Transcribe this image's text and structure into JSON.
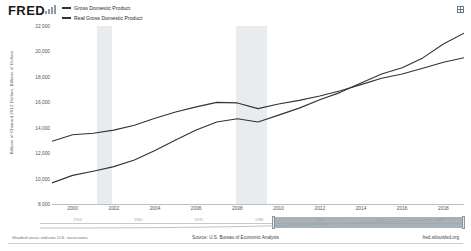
{
  "brand": {
    "name": "FRED",
    "logo_icon": "fred-bars-icon"
  },
  "header": {
    "expand_icon": "expand-icon"
  },
  "legend": {
    "position": "top-left",
    "items": [
      {
        "label": "Gross Domestic Product",
        "color": "#2f3437"
      },
      {
        "label": "Real Gross Domestic Product",
        "color": "#2f3437"
      }
    ]
  },
  "footer": {
    "note": "Shaded areas indicate U.S. recessions",
    "source": "Source: U.S. Bureau of Economic Analysis",
    "url": "fred.stlouisfed.org"
  },
  "range_slider": {
    "tick_labels": [
      "1950",
      "1960",
      "1970",
      "1980",
      "1990",
      "2000",
      "2010"
    ],
    "selection_start_pct": 55,
    "selection_end_pct": 100
  },
  "chart_data": {
    "type": "line",
    "title": "",
    "xlabel": "",
    "ylabel": "Billions of Chained 2012 Dollars, Billions of Dollars",
    "xlim": [
      1999,
      2019
    ],
    "ylim": [
      8000,
      22000
    ],
    "ytick_values": [
      8000,
      10000,
      12000,
      14000,
      16000,
      18000,
      20000,
      22000
    ],
    "ytick_labels": [
      "8,000",
      "10,000",
      "12,000",
      "14,000",
      "16,000",
      "18,000",
      "20,000",
      "22,000"
    ],
    "xtick_values": [
      2000,
      2002,
      2004,
      2006,
      2008,
      2010,
      2012,
      2014,
      2016,
      2018
    ],
    "xtick_labels": [
      "2000",
      "2002",
      "2004",
      "2006",
      "2008",
      "2010",
      "2012",
      "2014",
      "2016",
      "2018"
    ],
    "grid": false,
    "legend_position": "top-left",
    "recession_bands": [
      {
        "start": 2001.2,
        "end": 2001.9
      },
      {
        "start": 2007.95,
        "end": 2009.45
      }
    ],
    "x": [
      1999,
      2000,
      2001,
      2002,
      2003,
      2004,
      2005,
      2006,
      2007,
      2008,
      2009,
      2010,
      2011,
      2012,
      2013,
      2014,
      2015,
      2016,
      2017,
      2018,
      2019
    ],
    "series": [
      {
        "name": "Gross Domestic Product",
        "color": "#2f3437",
        "values": [
          9660,
          10250,
          10580,
          10940,
          11460,
          12210,
          13040,
          13820,
          14450,
          14710,
          14450,
          14990,
          15540,
          16200,
          16780,
          17520,
          18220,
          18710,
          19490,
          20580,
          21430
        ]
      },
      {
        "name": "Real Gross Domestic Product",
        "color": "#2f3437",
        "values": [
          12930,
          13450,
          13570,
          13810,
          14200,
          14740,
          15230,
          15640,
          15990,
          15950,
          15500,
          15870,
          16150,
          16500,
          16900,
          17390,
          17890,
          18220,
          18670,
          19150,
          19500
        ]
      }
    ]
  }
}
